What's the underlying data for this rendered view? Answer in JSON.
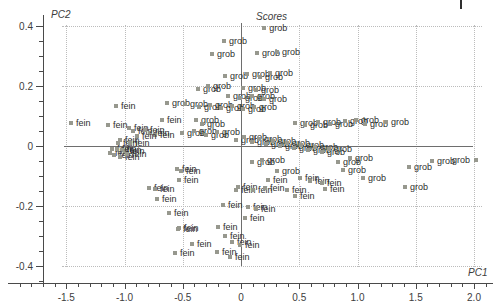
{
  "chart_data": {
    "type": "scatter",
    "title": "Scores",
    "xlabel": "PC1",
    "ylabel": "PC2",
    "xlim": [
      -1.75,
      2.15
    ],
    "ylim": [
      -0.46,
      0.45
    ],
    "grid": "dotted",
    "zero_crosshair": true,
    "legend_position": "none",
    "marker": {
      "shape": "square",
      "color": "#97988e",
      "size_px": 4
    },
    "point_label_color": "#2e2e2e",
    "x_ticks": [
      -1.5,
      -1.0,
      -0.5,
      0,
      0.5,
      1.0,
      1.5,
      2.0
    ],
    "x_tick_labels": [
      "-1.5",
      "-1.0",
      "-0.5",
      "0",
      "0.5",
      "1.0",
      "1.5",
      "2.0"
    ],
    "y_ticks": [
      0.4,
      0.2,
      0,
      -0.2,
      -0.4
    ],
    "y_tick_labels": [
      "0.4",
      "0.2",
      "0",
      "-0.2",
      "-0.4"
    ],
    "class_names": [
      "fein",
      "grob"
    ],
    "points": [
      [
        0.2,
        0.393,
        "grob"
      ],
      [
        -0.146,
        0.35,
        "grob"
      ],
      [
        -0.249,
        0.307,
        "grob"
      ],
      [
        0.137,
        0.31,
        "grob"
      ],
      [
        0.309,
        0.313,
        "grob"
      ],
      [
        -0.137,
        0.233,
        "grob"
      ],
      [
        0.052,
        0.24,
        "grob"
      ],
      [
        0.163,
        0.23,
        "grob"
      ],
      [
        0.249,
        0.243,
        "grob"
      ],
      [
        -0.369,
        0.19,
        "grob"
      ],
      [
        -0.283,
        0.2,
        "grob"
      ],
      [
        0.017,
        0.193,
        "grob"
      ],
      [
        0.129,
        0.187,
        "grob"
      ],
      [
        -0.112,
        0.167,
        "grob"
      ],
      [
        -0.009,
        0.16,
        "grob"
      ],
      [
        0.094,
        0.167,
        "grob"
      ],
      [
        0.197,
        0.157,
        "grob"
      ],
      [
        -0.635,
        0.143,
        "grob"
      ],
      [
        -0.481,
        0.14,
        "grob"
      ],
      [
        -0.361,
        0.13,
        "grob"
      ],
      [
        -0.266,
        0.137,
        "grob"
      ],
      [
        -0.172,
        0.127,
        "grob"
      ],
      [
        -0.077,
        0.133,
        "grob"
      ],
      [
        0.017,
        0.123,
        "grob"
      ],
      [
        0.112,
        0.13,
        "grob"
      ],
      [
        -0.386,
        0.087,
        "grob"
      ],
      [
        -0.335,
        0.073,
        "grob"
      ],
      [
        -0.506,
        0.043,
        "grob"
      ],
      [
        -0.403,
        0.05,
        "grob"
      ],
      [
        -0.3,
        0.037,
        "grob"
      ],
      [
        -0.206,
        0.047,
        "grob"
      ],
      [
        0.464,
        0.077,
        "grob"
      ],
      [
        0.549,
        0.07,
        "grob"
      ],
      [
        0.661,
        0.08,
        "grob"
      ],
      [
        0.764,
        0.073,
        "grob"
      ],
      [
        0.893,
        0.083,
        "grob"
      ],
      [
        0.987,
        0.087,
        "grob"
      ],
      [
        1.064,
        0.073,
        "grob"
      ],
      [
        1.245,
        0.08,
        "grob"
      ],
      [
        -0.043,
        0.02,
        "grob"
      ],
      [
        0.026,
        0.03,
        "grob"
      ],
      [
        0.094,
        0.013,
        "grob"
      ],
      [
        0.155,
        0.023,
        "grob"
      ],
      [
        0.215,
        0.007,
        "grob"
      ],
      [
        0.275,
        0.017,
        "grob"
      ],
      [
        0.335,
        0.0,
        "grob"
      ],
      [
        0.395,
        0.01,
        "grob"
      ],
      [
        0.455,
        -0.007,
        "grob"
      ],
      [
        0.515,
        0.003,
        "grob"
      ],
      [
        0.575,
        -0.013,
        "grob"
      ],
      [
        0.635,
        -0.003,
        "grob"
      ],
      [
        0.695,
        -0.02,
        "grob"
      ],
      [
        0.755,
        -0.01,
        "grob"
      ],
      [
        0.094,
        -0.053,
        "grob"
      ],
      [
        0.18,
        -0.047,
        "grob"
      ],
      [
        0.309,
        -0.083,
        "grob"
      ],
      [
        0.833,
        -0.053,
        "grob"
      ],
      [
        0.936,
        -0.04,
        "grob"
      ],
      [
        0.875,
        -0.08,
        "grob"
      ],
      [
        1.047,
        -0.107,
        "grob"
      ],
      [
        1.442,
        -0.07,
        "grob"
      ],
      [
        1.408,
        -0.137,
        "grob"
      ],
      [
        1.639,
        -0.05,
        "grob"
      ],
      [
        2.017,
        -0.047,
        "grob",
        "left"
      ],
      [
        -1.459,
        0.077,
        "fein"
      ],
      [
        -1.142,
        0.07,
        "fein"
      ],
      [
        -1.073,
        0.133,
        "fein"
      ],
      [
        -0.961,
        0.06,
        "fein"
      ],
      [
        -0.927,
        0.05,
        "fein"
      ],
      [
        -1.039,
        0.02,
        "fein"
      ],
      [
        -1.056,
        0.01,
        "fein"
      ],
      [
        -1.107,
        -0.01,
        "fein"
      ],
      [
        -1.124,
        -0.023,
        "fein"
      ],
      [
        -0.996,
        -0.017,
        "fein"
      ],
      [
        -0.678,
        0.087,
        "fein"
      ],
      [
        -0.781,
        0.043,
        "fein"
      ],
      [
        -0.738,
        0.037,
        "fein"
      ],
      [
        -0.824,
        0.053,
        "fein"
      ],
      [
        -0.893,
        0.033,
        "fein"
      ],
      [
        -0.953,
        0.01,
        "fein"
      ],
      [
        -1.064,
        -0.01,
        "fein"
      ],
      [
        -1.021,
        -0.013,
        "fein"
      ],
      [
        -1.09,
        -0.03,
        "fein"
      ],
      [
        -1.039,
        -0.037,
        "fein"
      ],
      [
        -0.979,
        -0.027,
        "fein"
      ],
      [
        -0.549,
        -0.077,
        "fein"
      ],
      [
        -0.515,
        -0.083,
        "fein"
      ],
      [
        -0.532,
        -0.113,
        "fein"
      ],
      [
        -0.79,
        -0.14,
        "fein"
      ],
      [
        -0.738,
        -0.143,
        "fein"
      ],
      [
        -0.721,
        -0.177,
        "fein"
      ],
      [
        -0.618,
        -0.223,
        "fein"
      ],
      [
        -0.541,
        -0.277,
        "fein"
      ],
      [
        -0.155,
        -0.197,
        "fein"
      ],
      [
        -0.043,
        -0.147,
        "fein"
      ],
      [
        0.06,
        -0.203,
        "fein"
      ],
      [
        0.129,
        -0.21,
        "fein"
      ],
      [
        0.034,
        -0.24,
        "fein"
      ],
      [
        -0.197,
        -0.27,
        "fein"
      ],
      [
        -0.077,
        -0.32,
        "fein"
      ],
      [
        -0.009,
        -0.33,
        "fein"
      ],
      [
        -0.026,
        -0.137,
        "fein"
      ],
      [
        0.103,
        -0.147,
        "fein"
      ],
      [
        -0.532,
        -0.273,
        "fein"
      ],
      [
        -0.567,
        -0.357,
        "fein"
      ],
      [
        -0.421,
        -0.327,
        "fein"
      ],
      [
        -0.137,
        -0.3,
        "fein"
      ],
      [
        -0.206,
        -0.353,
        "fein"
      ],
      [
        -0.094,
        -0.37,
        "fein"
      ],
      [
        0.206,
        -0.14,
        "fein"
      ],
      [
        0.395,
        -0.147,
        "fein"
      ],
      [
        0.232,
        -0.113,
        "fein"
      ],
      [
        0.506,
        -0.107,
        "fein"
      ],
      [
        0.592,
        -0.117,
        "fein"
      ],
      [
        0.695,
        -0.123,
        "fein"
      ],
      [
        0.464,
        -0.167,
        "fein"
      ],
      [
        0.721,
        -0.143,
        "fein"
      ]
    ]
  }
}
